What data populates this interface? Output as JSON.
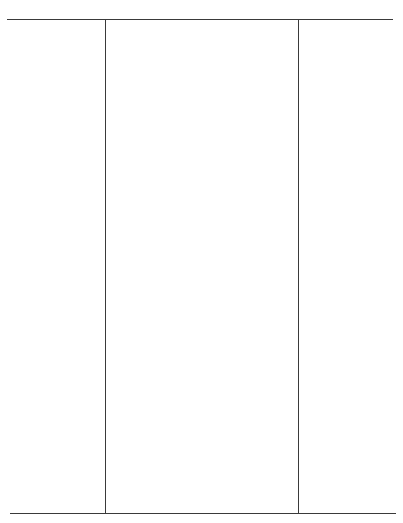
{
  "document": {
    "type": "blank ruled table form",
    "header_text": "",
    "columns": [
      {
        "label": ""
      },
      {
        "label": ""
      },
      {
        "label": ""
      }
    ],
    "rows": [],
    "colors": {
      "background": "#ffffff",
      "rule": "#3a3a3a"
    }
  }
}
